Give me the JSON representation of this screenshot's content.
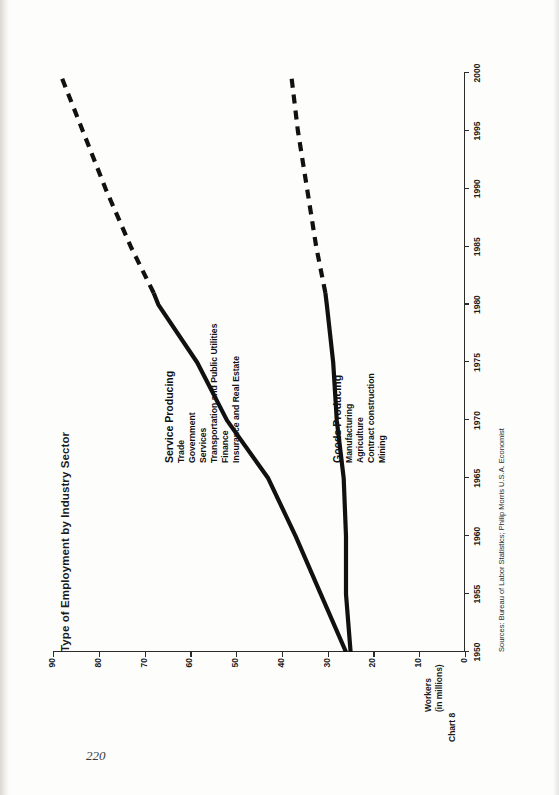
{
  "page": {
    "folio": "220"
  },
  "figure": {
    "chart_number": "Chart 8",
    "title": "Type of Employment by Industry Sector",
    "y_caption_line1": "Workers",
    "y_caption_line2": "(in millions)",
    "sources": "Sources: Bureau of Labor Statistics; Philip Morris U.S.A. Economist"
  },
  "legends": {
    "service": {
      "heading": "Service Producing",
      "items": [
        "Trade",
        "Government",
        "Services",
        "Transportation and Public Utilities",
        "Finance",
        "Insurance and Real Estate"
      ]
    },
    "goods": {
      "heading": "Goods Producing",
      "items": [
        "Manufacturing",
        "Agriculture",
        "Contract construction",
        "Mining"
      ]
    }
  },
  "chart_data": {
    "type": "line",
    "title": "Type of Employment by Industry Sector",
    "xlabel": "",
    "ylabel": "Workers (in millions)",
    "xlim": [
      1950,
      2000
    ],
    "ylim": [
      0,
      90
    ],
    "grid": false,
    "legend_position": "inside-right",
    "xticks": [
      1950,
      1955,
      1960,
      1965,
      1970,
      1975,
      1980,
      1985,
      1990,
      1995,
      2000
    ],
    "yticks": [
      0,
      10,
      20,
      30,
      40,
      50,
      60,
      70,
      80,
      90
    ],
    "line_color": "#111111",
    "series": [
      {
        "name": "Service Producing",
        "style_actual": "solid",
        "style_projected": "dashed",
        "projection_starts": 1981,
        "x": [
          1950,
          1955,
          1960,
          1965,
          1970,
          1975,
          1980,
          1981,
          1985,
          1990,
          1995,
          2000
        ],
        "values": [
          26.0,
          31.5,
          37.0,
          43.0,
          52.0,
          58.5,
          67.0,
          68.0,
          73.0,
          78.5,
          83.5,
          88.5
        ]
      },
      {
        "name": "Goods Producing",
        "style_actual": "solid",
        "style_projected": "dashed",
        "projection_starts": 1981,
        "x": [
          1950,
          1955,
          1960,
          1965,
          1970,
          1975,
          1980,
          1981,
          1985,
          1990,
          1995,
          2000
        ],
        "values": [
          25.0,
          26.0,
          26.0,
          26.5,
          28.0,
          28.8,
          30.2,
          30.5,
          32.5,
          34.5,
          36.5,
          38.0
        ]
      }
    ]
  }
}
